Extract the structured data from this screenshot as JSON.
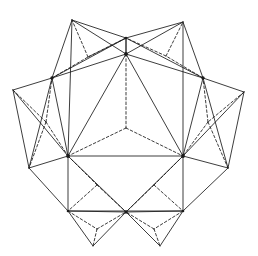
{
  "figure": {
    "type": "line-diagram",
    "background_color": "#ffffff",
    "stroke_color": "#1a1a1a",
    "solid_stroke_width": 0.85,
    "dashed_stroke_width": 0.85,
    "dash_pattern": "2.6 2.2",
    "canvas": {
      "width": 258,
      "height": 256
    },
    "hub_vertices": [
      {
        "name": "hub-top",
        "x": 126,
        "y": 54
      },
      {
        "name": "hub-upper-left",
        "x": 52,
        "y": 78
      },
      {
        "name": "hub-upper-right",
        "x": 203,
        "y": 78
      },
      {
        "name": "hub-lower-left",
        "x": 68,
        "y": 156
      },
      {
        "name": "hub-lower-right",
        "x": 183,
        "y": 156
      },
      {
        "name": "hub-bottom-center",
        "x": 126,
        "y": 212
      }
    ],
    "solid_paths": [
      "M126,54 L52,78",
      "M52,78 L68,156",
      "M68,156 L183,156",
      "M183,156 L203,78",
      "M203,78 L126,54",
      "M126,54 L68,156",
      "M126,54 L183,156",
      "M52,78 L13,90",
      "M13,90 L29,168",
      "M29,168 L68,156",
      "M52,78 L72,20",
      "M72,20 L126,38",
      "M126,38 L126,54",
      "M126,54 L72,20",
      "M126,54 L126,38",
      "M126,38 L183,22",
      "M183,22 L203,78",
      "M126,54 L183,22",
      "M203,78 L244,92",
      "M244,92 L228,168",
      "M228,168 L183,156",
      "M203,78 L228,168",
      "M52,78 L29,168",
      "M68,156 L68,211",
      "M68,211 L183,211",
      "M183,211 L183,156",
      "M68,156 L126,212",
      "M183,156 L126,212",
      "M68,211 L93,246",
      "M93,246 L126,212",
      "M126,212 L160,246",
      "M160,246 L183,211",
      "M68,211 L126,212",
      "M126,212 L183,211",
      "M13,90 L68,156",
      "M244,92 L183,156",
      "M29,168 L68,211",
      "M228,168 L183,211",
      "M72,20 L68,156",
      "M183,22 L183,156",
      "M52,78 L126,38",
      "M203,78 L126,38"
    ],
    "dashed_paths": [
      "M126,54 L126,128",
      "M126,128 L68,156",
      "M126,128 L183,156",
      "M52,78 L88,57",
      "M88,57 L72,20",
      "M88,57 L126,38",
      "M126,38 L88,57",
      "M203,78 L166,56",
      "M166,56 L183,22",
      "M166,56 L126,38",
      "M13,90 L46,122",
      "M46,122 L29,168",
      "M46,122 L68,156",
      "M46,122 L52,78",
      "M244,92 L208,122",
      "M208,122 L228,168",
      "M208,122 L183,156",
      "M208,122 L203,78",
      "M68,211 L97,229",
      "M97,229 L93,246",
      "M97,229 L126,212",
      "M183,211 L154,229",
      "M154,229 L160,246",
      "M154,229 L126,212",
      "M68,156 L97,185",
      "M97,185 L68,211",
      "M97,185 L126,212",
      "M183,156 L154,185",
      "M154,185 L183,211",
      "M154,185 L126,212"
    ],
    "vertex_dots": [
      {
        "x": 126,
        "y": 54,
        "r": 1.9
      },
      {
        "x": 52,
        "y": 78,
        "r": 1.7
      },
      {
        "x": 203,
        "y": 78,
        "r": 1.7
      },
      {
        "x": 68,
        "y": 156,
        "r": 1.9
      },
      {
        "x": 183,
        "y": 156,
        "r": 1.9
      },
      {
        "x": 126,
        "y": 212,
        "r": 1.7
      },
      {
        "x": 68,
        "y": 211,
        "r": 1.3
      },
      {
        "x": 183,
        "y": 211,
        "r": 1.3
      },
      {
        "x": 126,
        "y": 38,
        "r": 1.3
      }
    ]
  }
}
